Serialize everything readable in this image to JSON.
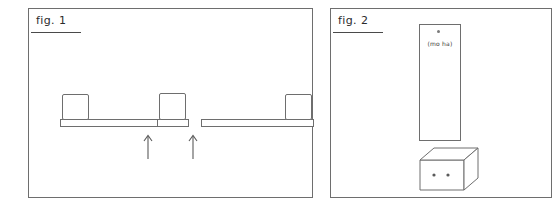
{
  "drawing": {
    "title": "Hand-drawn shelf assembly sketch",
    "style": "line-drawing",
    "stroke_color": "#6e6e6e",
    "background_color": "#ffffff",
    "panels": [
      {
        "id": "fig1",
        "label": "fig. 1",
        "description": "Three shelf units in a row: a long shelf with a box at its left end, a short shelf with a box, and a long shelf with a box at its right end. Two upward arrows point at the gaps below the middle unit.",
        "arrows": [
          {
            "name": "arrow-left",
            "direction": "up",
            "glyph": "arrow-up-icon"
          },
          {
            "name": "arrow-right",
            "direction": "up",
            "glyph": "arrow-up-icon"
          }
        ],
        "units": [
          {
            "name": "shelf-unit-left",
            "box_position": "left"
          },
          {
            "name": "shelf-unit-mid",
            "box_position": "center"
          },
          {
            "name": "shelf-unit-right",
            "box_position": "right"
          }
        ]
      },
      {
        "id": "fig2",
        "label": "fig. 2",
        "description": "A tall vertical panel standing on a 3D box base. The box front face carries two small dots.",
        "tall_panel": {
          "name": "tall-panel",
          "mark": "dot",
          "note": "(mo ha)"
        },
        "base_box": {
          "name": "base-box",
          "dots": 2
        }
      }
    ]
  }
}
